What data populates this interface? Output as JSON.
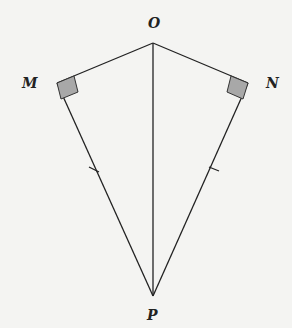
{
  "diagram": {
    "type": "geometry-kite",
    "labels": {
      "O": "O",
      "M": "M",
      "N": "N",
      "P": "P"
    },
    "points": {
      "O": [
        153,
        43
      ],
      "M": [
        57,
        83
      ],
      "N": [
        248,
        83
      ],
      "P": [
        153,
        296
      ]
    },
    "segments": [
      "OM",
      "ON",
      "MP",
      "NP",
      "OP"
    ],
    "right_angles": [
      "M",
      "N"
    ],
    "congruence_ticks": [
      "MP",
      "NP"
    ],
    "colors": {
      "line": "#222222",
      "right_angle_fill": "#a8a8a8"
    }
  }
}
